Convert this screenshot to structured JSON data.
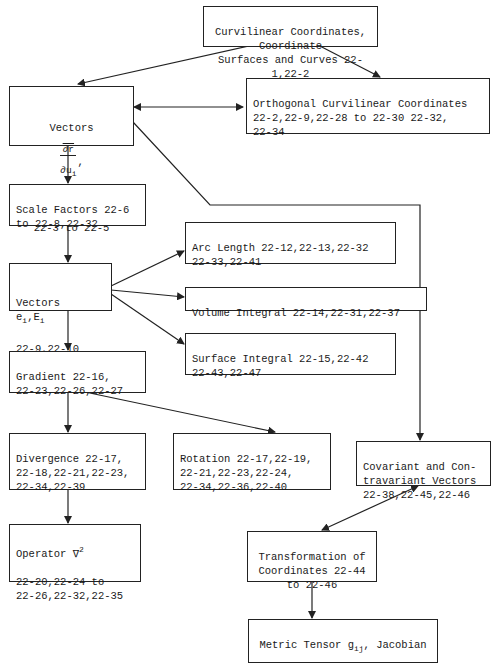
{
  "diagram": {
    "nodes": {
      "curvilinear": {
        "text": "Curvilinear Coordinates, Coordinate\nSurfaces and Curves 22-1,22-2"
      },
      "vectors_dr": {
        "label": "Vectors",
        "frac_num": "∂r",
        "frac_den": "∂u",
        "frac_sub": "i",
        "nabla": "∇u",
        "nabla_sub": "i",
        "refs": "22-3 to 22-5"
      },
      "orthogonal": {
        "text": "Orthogonal Curvilinear Coordinates\n22-2,22-9,22-28 to 22-30 22-32,\n22-34"
      },
      "scale_factors": {
        "text": "Scale Factors 22-6\nto 22-8,22-32"
      },
      "vectors_e": {
        "label": "Vectors",
        "e": "e",
        "E": "E",
        "sub": "i",
        "refs": "22-9,22-10"
      },
      "arc_length": {
        "text": "Arc Length 22-12,22-13,22-32\n22-33,22-41"
      },
      "volume_integral": {
        "text": "Volume Integral 22-14,22-31,22-37"
      },
      "surface_integral": {
        "text": "Surface Integral 22-15,22-42\n22-43,22-47"
      },
      "gradient": {
        "text": "Gradient 22-16,\n22-23,22-26,22-27"
      },
      "divergence": {
        "text": "Divergence 22-17,\n22-18,22-21,22-23,\n22-34,22-39"
      },
      "rotation": {
        "text": "Rotation 22-17,22-19,\n22-21,22-23,22-24,\n22-34,22-36,22-40"
      },
      "covariant": {
        "text": "Covariant and Con-\ntravariant Vectors\n22-38,22-45,22-46"
      },
      "operator": {
        "label": "Operator ∇",
        "sup": "2",
        "refs": "22-20,22-24 to\n22-26,22-32,22-35"
      },
      "transformation": {
        "text": "Transformation of\nCoordinates 22-44\nto 22-46"
      },
      "metric": {
        "label": "Metric Tensor g",
        "sub": "ij",
        "label2": ", Jacobian",
        "refs": "22-48 to 22-51"
      }
    },
    "edges": [
      {
        "from": "curvilinear",
        "to": "vectors_dr"
      },
      {
        "from": "curvilinear",
        "to": "orthogonal"
      },
      {
        "from": "vectors_dr",
        "to": "orthogonal",
        "bidirectional": true
      },
      {
        "from": "vectors_dr",
        "to": "scale_factors"
      },
      {
        "from": "vectors_dr",
        "to": "covariant"
      },
      {
        "from": "scale_factors",
        "to": "vectors_e"
      },
      {
        "from": "vectors_e",
        "to": "arc_length"
      },
      {
        "from": "vectors_e",
        "to": "volume_integral"
      },
      {
        "from": "vectors_e",
        "to": "surface_integral"
      },
      {
        "from": "vectors_e",
        "to": "gradient"
      },
      {
        "from": "gradient",
        "to": "divergence"
      },
      {
        "from": "gradient",
        "to": "rotation"
      },
      {
        "from": "divergence",
        "to": "operator"
      },
      {
        "from": "covariant",
        "to": "transformation",
        "bidirectional": true
      },
      {
        "from": "transformation",
        "to": "metric"
      }
    ]
  }
}
